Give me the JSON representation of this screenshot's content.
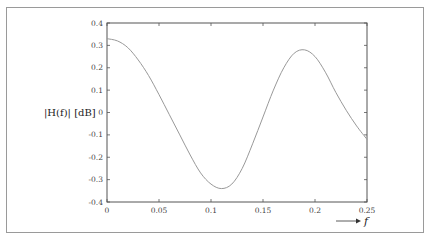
{
  "chart_data": {
    "type": "line",
    "title": "",
    "xlabel": "f",
    "ylabel": "|H(f)| [dB]",
    "xlim": [
      0,
      0.25
    ],
    "ylim": [
      -0.4,
      0.4
    ],
    "grid": false,
    "legend": null,
    "x_ticks": [
      "0",
      "0.05",
      "0.1",
      "0.15",
      "0.2",
      "0.25"
    ],
    "y_ticks": [
      "0.4",
      "0.3",
      "0.2",
      "0.1",
      "0",
      "-0.1",
      "-0.2",
      "-0.3",
      "-0.4"
    ],
    "series": [
      {
        "name": "|H(f)|",
        "color": "#999999",
        "x": [
          0,
          0.01,
          0.02,
          0.03,
          0.04,
          0.05,
          0.06,
          0.07,
          0.08,
          0.09,
          0.1,
          0.11,
          0.12,
          0.13,
          0.14,
          0.15,
          0.16,
          0.17,
          0.18,
          0.19,
          0.2,
          0.21,
          0.22,
          0.23,
          0.24,
          0.25
        ],
        "values": [
          0.33,
          0.32,
          0.29,
          0.235,
          0.165,
          0.08,
          -0.01,
          -0.1,
          -0.19,
          -0.27,
          -0.32,
          -0.34,
          -0.32,
          -0.25,
          -0.14,
          -0.02,
          0.1,
          0.2,
          0.265,
          0.28,
          0.25,
          0.18,
          0.09,
          0.01,
          -0.06,
          -0.12
        ]
      }
    ]
  },
  "axes": {
    "ylabel": "|H(f)| [dB]",
    "xlabel": "f",
    "xlabel_arrow": "→"
  }
}
